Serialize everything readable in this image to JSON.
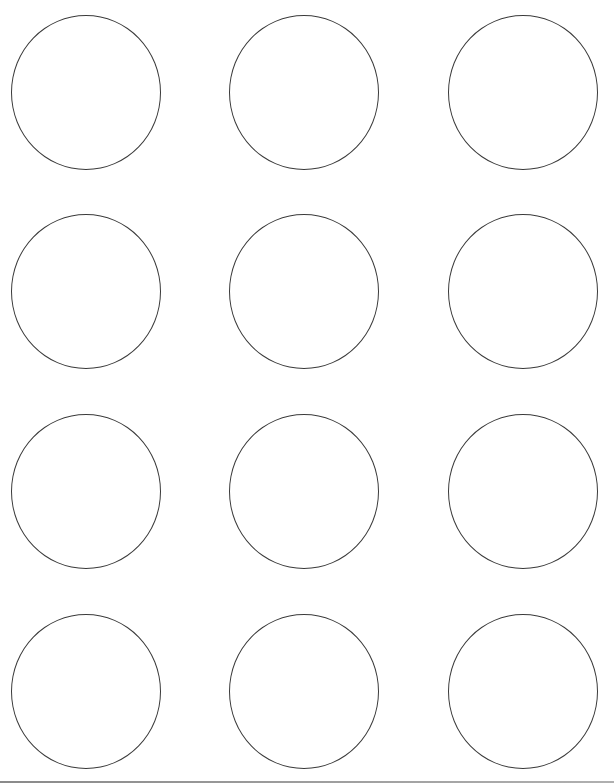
{
  "document": {
    "type": "round label template sheet",
    "rows": 4,
    "columns": 3,
    "circle_stroke_color": "#3a3a3a",
    "background_color": "#ffffff",
    "top_cut_text": "",
    "labels": [
      {
        "row": 1,
        "col": 1
      },
      {
        "row": 1,
        "col": 2
      },
      {
        "row": 1,
        "col": 3
      },
      {
        "row": 2,
        "col": 1
      },
      {
        "row": 2,
        "col": 2
      },
      {
        "row": 2,
        "col": 3
      },
      {
        "row": 3,
        "col": 1
      },
      {
        "row": 3,
        "col": 2
      },
      {
        "row": 3,
        "col": 3
      },
      {
        "row": 4,
        "col": 1
      },
      {
        "row": 4,
        "col": 2
      },
      {
        "row": 4,
        "col": 3
      }
    ]
  }
}
